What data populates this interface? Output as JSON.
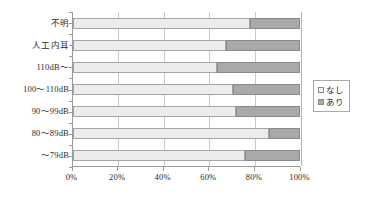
{
  "chart_data": {
    "type": "bar",
    "orientation": "horizontal",
    "stacked": true,
    "normalized_percent": true,
    "title": "",
    "subtitle": "",
    "xlabel": "",
    "ylabel": "",
    "xlim": [
      0,
      100
    ],
    "grid": true,
    "legend_position": "right",
    "categories": [
      "不明",
      "人工内耳",
      "110dB～",
      "100～110dB",
      "90～99dB",
      "80～89dB",
      "～79dB"
    ],
    "x_tick_labels": [
      "0%",
      "20%",
      "40%",
      "60%",
      "80%",
      "100%"
    ],
    "x_tick_values": [
      0,
      20,
      40,
      60,
      80,
      100
    ],
    "series": [
      {
        "name": "なし",
        "color": "#ececec",
        "values": [
          77.8,
          67.2,
          63.2,
          70.5,
          71.6,
          86.3,
          75.8
        ]
      },
      {
        "name": "あり",
        "color": "#a9a9a9",
        "values": [
          22.2,
          32.8,
          36.8,
          29.5,
          28.4,
          13.7,
          24.2
        ]
      }
    ],
    "legend": [
      {
        "label": "なし",
        "swatch": "legend-swatch-nashi"
      },
      {
        "label": "あり",
        "swatch": "legend-swatch-ari"
      }
    ]
  },
  "colors": {
    "series_nashi": "#ececec",
    "series_ari": "#a9a9a9",
    "axis": "#9a9a9a",
    "gridline": "#c9c9c9",
    "text": "#2b2b2b",
    "background": "#ffffff"
  }
}
